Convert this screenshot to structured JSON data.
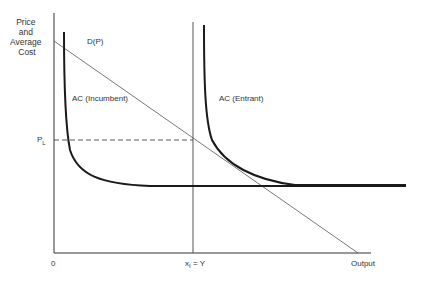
{
  "diagram": {
    "type": "economics-entry-deterrence",
    "y_axis_title": [
      "Price",
      "and",
      "Average",
      "Cost"
    ],
    "x_axis_title": "Output",
    "origin_label": "0",
    "price_marker": {
      "symbol": "P",
      "subscript": "L"
    },
    "quantity_marker": {
      "symbol": "x",
      "subscript": "I",
      "suffix": " = Y"
    },
    "curves": {
      "demand": {
        "label": "D(P)"
      },
      "ac_incumbent": {
        "label": "AC (Incumbent)"
      },
      "ac_entrant": {
        "label": "AC (Entrant)"
      }
    },
    "colors": {
      "axis": "#333333",
      "demand": "#555555",
      "ac_curve": "#1a1a1a",
      "dashed": "#444444",
      "text": "#333333"
    }
  }
}
